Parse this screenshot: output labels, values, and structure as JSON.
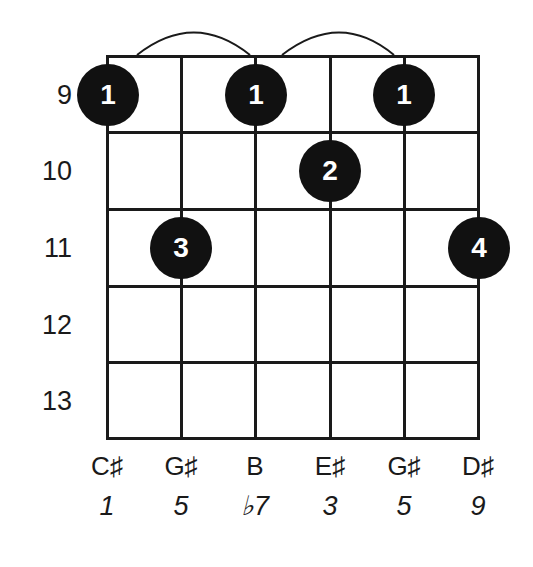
{
  "diagram": {
    "type": "guitar-chord-diagram",
    "chord_tones_root": "C#",
    "start_fret": 9,
    "fret_labels": [
      "9",
      "10",
      "11",
      "12",
      "13"
    ],
    "strings": [
      {
        "note": "C♯",
        "degree": "1"
      },
      {
        "note": "G♯",
        "degree": "5"
      },
      {
        "note": "B",
        "degree": "♭7"
      },
      {
        "note": "E♯",
        "degree": "3"
      },
      {
        "note": "G♯",
        "degree": "5"
      },
      {
        "note": "D♯",
        "degree": "9"
      }
    ],
    "fingerings": [
      {
        "string": 0,
        "fret": 9,
        "finger": "1"
      },
      {
        "string": 1,
        "fret": 11,
        "finger": "3"
      },
      {
        "string": 2,
        "fret": 9,
        "finger": "1"
      },
      {
        "string": 3,
        "fret": 10,
        "finger": "2"
      },
      {
        "string": 4,
        "fret": 9,
        "finger": "1"
      },
      {
        "string": 5,
        "fret": 11,
        "finger": "4"
      }
    ],
    "ties": [
      {
        "from_string": 0,
        "to_string": 2
      },
      {
        "from_string": 2,
        "to_string": 4
      }
    ],
    "colors": {
      "line": "#1a1a1a",
      "dot": "#111111",
      "dot_text": "#ffffff",
      "background": "#ffffff"
    }
  }
}
